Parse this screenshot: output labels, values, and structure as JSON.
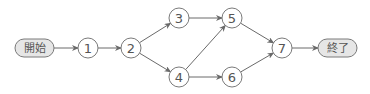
{
  "diagram": {
    "type": "arrow-network",
    "colors": {
      "stroke": "#7a7a7a",
      "terminal_fill": "#e6e6e6",
      "text": "#555555"
    },
    "terminals": {
      "start": {
        "label": "開始",
        "x": 15,
        "y": 39,
        "w": 39,
        "h": 18
      },
      "end": {
        "label": "終了",
        "x": 318,
        "y": 39,
        "w": 39,
        "h": 18
      }
    },
    "nodes": [
      {
        "id": "1",
        "label": "1",
        "cx": 88,
        "cy": 48
      },
      {
        "id": "2",
        "label": "2",
        "cx": 131,
        "cy": 48
      },
      {
        "id": "3",
        "label": "3",
        "cx": 179,
        "cy": 18
      },
      {
        "id": "4",
        "label": "4",
        "cx": 179,
        "cy": 77
      },
      {
        "id": "5",
        "label": "5",
        "cx": 232,
        "cy": 18
      },
      {
        "id": "6",
        "label": "6",
        "cx": 232,
        "cy": 77
      },
      {
        "id": "7",
        "label": "7",
        "cx": 282,
        "cy": 48
      }
    ],
    "edges": [
      {
        "from": "開始",
        "to": "1"
      },
      {
        "from": "1",
        "to": "2"
      },
      {
        "from": "2",
        "to": "3"
      },
      {
        "from": "2",
        "to": "4"
      },
      {
        "from": "3",
        "to": "5"
      },
      {
        "from": "4",
        "to": "5"
      },
      {
        "from": "4",
        "to": "6"
      },
      {
        "from": "5",
        "to": "7"
      },
      {
        "from": "6",
        "to": "7"
      },
      {
        "from": "7",
        "to": "終了"
      }
    ]
  }
}
